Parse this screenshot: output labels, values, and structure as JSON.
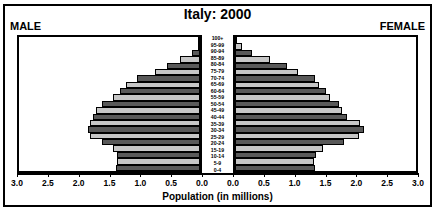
{
  "chart_title": "Italy: 2000",
  "male_label": "MALE",
  "female_label": "FEMALE",
  "axis_title": "Population (in millions)",
  "tick_labels": [
    "3.0",
    "2.5",
    "2.0",
    "1.5",
    "1.0",
    "0.5",
    "0.0",
    "0.0",
    "0.5",
    "1.0",
    "1.5",
    "2.0",
    "2.5",
    "3.0"
  ],
  "colors": {
    "bar_dark": "#595959",
    "bar_light": "#c6c6c6",
    "outline": "#000000",
    "background": "#ffffff"
  },
  "chart_data": {
    "type": "bar",
    "subtype": "population-pyramid",
    "title": "Italy: 2000",
    "xlabel": "Population (in millions)",
    "ylabel": "",
    "xlim": [
      0,
      3.0
    ],
    "xticks": [
      0.0,
      0.5,
      1.0,
      1.5,
      2.0,
      2.5,
      3.0
    ],
    "grid": false,
    "legend": [
      "MALE",
      "FEMALE"
    ],
    "legend_position": "top-corners",
    "orientation": "horizontal",
    "categories": [
      "100+",
      "95-99",
      "90-94",
      "85-89",
      "80-84",
      "75-79",
      "70-74",
      "65-69",
      "60-64",
      "55-59",
      "50-54",
      "45-49",
      "40-44",
      "35-39",
      "30-34",
      "25-29",
      "20-24",
      "15-19",
      "10-14",
      "5-9",
      "0-4"
    ],
    "series": [
      {
        "name": "MALE",
        "side": "left",
        "values": [
          0.01,
          0.04,
          0.13,
          0.33,
          0.55,
          0.74,
          1.04,
          1.22,
          1.33,
          1.44,
          1.62,
          1.72,
          1.78,
          1.83,
          1.85,
          1.82,
          1.63,
          1.44,
          1.38,
          1.37,
          1.4
        ]
      },
      {
        "name": "FEMALE",
        "side": "right",
        "values": [
          0.03,
          0.11,
          0.28,
          0.58,
          0.86,
          1.04,
          1.33,
          1.4,
          1.5,
          1.58,
          1.72,
          1.78,
          1.86,
          2.08,
          2.13,
          2.05,
          1.8,
          1.46,
          1.34,
          1.31,
          1.32
        ]
      }
    ]
  }
}
